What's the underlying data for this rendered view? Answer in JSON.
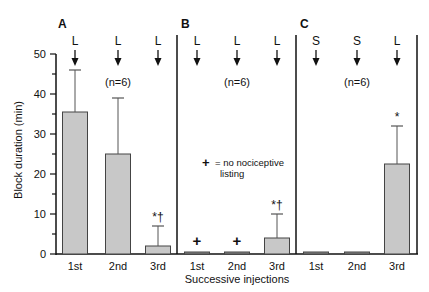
{
  "chart_data": {
    "type": "bar",
    "title": "",
    "ylabel": "Block duration (min)",
    "xlabel": "Successive injections",
    "ylim": [
      0,
      50
    ],
    "yticks": [
      0,
      10,
      20,
      30,
      40,
      50
    ],
    "grid": false,
    "categories": [
      "1st",
      "2nd",
      "3rd"
    ],
    "bar_color": "#c8c8c8",
    "legend_note": {
      "symbol": "+",
      "text_line1": "= no nociceptive",
      "text_line2": "listing"
    },
    "panels": [
      {
        "label": "A",
        "n_label": "(n=6)",
        "injection_labels": [
          "L",
          "L",
          "L"
        ],
        "values": [
          35.5,
          25,
          2
        ],
        "error_upper": [
          46,
          39,
          7
        ],
        "annotations": [
          "",
          "",
          "*†"
        ],
        "no_nociceptive_listing": [
          false,
          false,
          false
        ]
      },
      {
        "label": "B",
        "n_label": "(n=6)",
        "injection_labels": [
          "L",
          "L",
          "L"
        ],
        "values": [
          0.5,
          0.5,
          4
        ],
        "error_upper": [
          null,
          null,
          10
        ],
        "annotations": [
          "+",
          "+",
          "*†"
        ],
        "no_nociceptive_listing": [
          true,
          true,
          false
        ]
      },
      {
        "label": "C",
        "n_label": "(n=6)",
        "injection_labels": [
          "S",
          "S",
          "L"
        ],
        "values": [
          0.5,
          0.5,
          22.5
        ],
        "error_upper": [
          null,
          null,
          32
        ],
        "annotations": [
          "",
          "",
          "*"
        ],
        "no_nociceptive_listing": [
          false,
          false,
          false
        ]
      }
    ]
  }
}
